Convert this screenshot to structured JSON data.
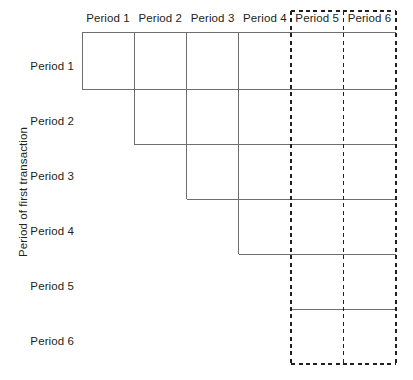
{
  "figure": {
    "type": "run-off-triangle-diagram",
    "y_axis_label": "Period of first transaction",
    "column_headers": [
      "Period 1",
      "Period 2",
      "Period 3",
      "Period 4",
      "Period 5",
      "Period 6"
    ],
    "row_headers": [
      "Period 1",
      "Period 2",
      "Period 3",
      "Period 4",
      "Period 5",
      "Period 6"
    ],
    "colors": {
      "line": "#6d6e71",
      "dashed_highlight": "#231f20",
      "text": "#231f20",
      "background": "#ffffff"
    },
    "highlight": {
      "style": "dashed-rectangle",
      "columns": [
        "Period 5",
        "Period 6"
      ],
      "internal_divider_after": "Period 5"
    },
    "geometry": {
      "grid_left": 82,
      "grid_top": 32,
      "grid_right": 396,
      "grid_bottom": 364,
      "column_width": 52.3,
      "row_height": 55.3,
      "column_x": [
        82,
        134.3,
        186.6,
        238.9,
        291.2,
        343.5,
        395.8
      ],
      "row_y": [
        32,
        89,
        144,
        199,
        254,
        309,
        364
      ]
    },
    "staircase": {
      "description": "Each row of the triangle ends one column further right than the row above, forming a descending staircase of cell outlines.",
      "steps": [
        {
          "row": 1,
          "filled_columns": 1,
          "corner_x": 82,
          "corner_y": 89
        },
        {
          "row": 2,
          "filled_columns": 2,
          "corner_x": 134.3,
          "corner_y": 144
        },
        {
          "row": 3,
          "filled_columns": 3,
          "corner_x": 186.6,
          "corner_y": 199
        },
        {
          "row": 4,
          "filled_columns": 4,
          "corner_x": 238.9,
          "corner_y": 254
        },
        {
          "row": 5,
          "filled_columns": 5,
          "corner_x": 291.2,
          "corner_y": 309
        },
        {
          "row": 6,
          "filled_columns": 6,
          "corner_x": 343.5,
          "corner_y": 364
        }
      ]
    }
  }
}
